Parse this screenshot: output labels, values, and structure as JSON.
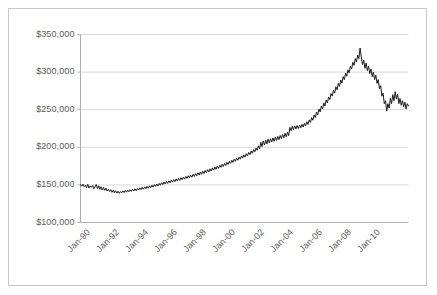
{
  "frame": {
    "border_color": "#c9c9c9",
    "background": "#ffffff"
  },
  "chart_data": {
    "type": "line",
    "title": "",
    "subtitle": "",
    "xlabel": "",
    "ylabel": "",
    "grid": "horizontal",
    "legend": "none",
    "line_color": "#1a1a1a",
    "grid_color": "#d9d9d9",
    "axis_color": "#b0b0b0",
    "ylim": [
      100000,
      350000
    ],
    "ytick_values": [
      100000,
      150000,
      200000,
      250000,
      300000,
      350000
    ],
    "ytick_labels": [
      "$100,000",
      "$150,000",
      "$200,000",
      "$250,000",
      "$300,000",
      "$350,000"
    ],
    "xlim": [
      "Jan-90",
      "Jul-11"
    ],
    "xtick_labels": [
      "Jan-90",
      "Jan-92",
      "Jan-94",
      "Jan-96",
      "Jan-98",
      "Jan-00",
      "Jan-02",
      "Jan-04",
      "Jan-06",
      "Jan-08",
      "Jan-10"
    ],
    "x_start_year": 1990,
    "x_start_month": 1,
    "x_interval": "monthly",
    "x_points": 258,
    "notable_values": {
      "start_1990": 150000,
      "trough_1993": 139000,
      "level_1996": 152000,
      "level_1999": 186000,
      "jump_2000": 206000,
      "plateau_2002": 227000,
      "peak_2007": 332000,
      "trough_2009": 247000,
      "end_2011": 256000
    },
    "values": [
      150500,
      148200,
      151000,
      147800,
      149500,
      146200,
      150800,
      145900,
      148600,
      146800,
      149200,
      144800,
      147300,
      150600,
      145200,
      148900,
      144100,
      147600,
      143200,
      146500,
      142800,
      145600,
      141900,
      144300,
      141200,
      143800,
      140100,
      142900,
      139600,
      142200,
      139100,
      141600,
      138800,
      141200,
      139400,
      142000,
      139800,
      142600,
      140300,
      143100,
      140900,
      143600,
      141400,
      144200,
      141800,
      144800,
      142400,
      145200,
      143100,
      146000,
      143700,
      146800,
      144300,
      147400,
      145000,
      148200,
      145600,
      148900,
      146300,
      149600,
      147100,
      150400,
      148000,
      151200,
      148800,
      152000,
      149600,
      152900,
      150400,
      153800,
      151200,
      154600,
      152000,
      155400,
      152800,
      156200,
      153600,
      157000,
      154400,
      157900,
      155200,
      158800,
      156000,
      159600,
      156900,
      160400,
      157700,
      161300,
      158600,
      162200,
      159400,
      163000,
      160300,
      164000,
      161200,
      165000,
      162100,
      166000,
      163000,
      167100,
      164000,
      168200,
      165100,
      169200,
      166200,
      170300,
      167300,
      171400,
      168400,
      172600,
      169600,
      173800,
      170800,
      175000,
      172000,
      176200,
      173300,
      177400,
      174500,
      178600,
      175800,
      180000,
      177200,
      181400,
      178600,
      182800,
      180000,
      184200,
      181400,
      185600,
      182800,
      187000,
      184200,
      188400,
      185600,
      190000,
      187000,
      191600,
      188600,
      193200,
      190200,
      195000,
      192000,
      197000,
      194000,
      199000,
      196000,
      202000,
      198000,
      206500,
      201000,
      208500,
      203000,
      209500,
      204500,
      210800,
      206000,
      211500,
      207000,
      212500,
      208000,
      213500,
      209000,
      214500,
      210200,
      215800,
      211500,
      217000,
      212800,
      218500,
      214000,
      220000,
      215500,
      226500,
      222000,
      228000,
      223500,
      228500,
      224500,
      229000,
      225000,
      229500,
      226000,
      230500,
      227000,
      232000,
      228500,
      234000,
      230500,
      236500,
      233000,
      239500,
      236000,
      243000,
      239500,
      247000,
      243000,
      251000,
      247000,
      255000,
      251000,
      259000,
      255000,
      263000,
      259000,
      267000,
      263500,
      271500,
      268000,
      276000,
      272000,
      280500,
      276500,
      285000,
      281000,
      289500,
      285500,
      294000,
      290000,
      298500,
      294500,
      303000,
      299000,
      308000,
      304000,
      313000,
      309000,
      318000,
      313500,
      322500,
      318000,
      332000,
      320000,
      310000,
      316000,
      305000,
      312000,
      302000,
      308000,
      298000,
      304000,
      294000,
      300000,
      290000,
      296000,
      285000,
      290000,
      278000,
      282000,
      268000,
      272000,
      258000,
      262000,
      248000,
      258000,
      252000,
      265000,
      258000,
      270000,
      262000,
      274000,
      264000,
      271000,
      258000,
      265000,
      256000,
      262000,
      254000,
      260000,
      251000,
      258000,
      255000
    ]
  }
}
